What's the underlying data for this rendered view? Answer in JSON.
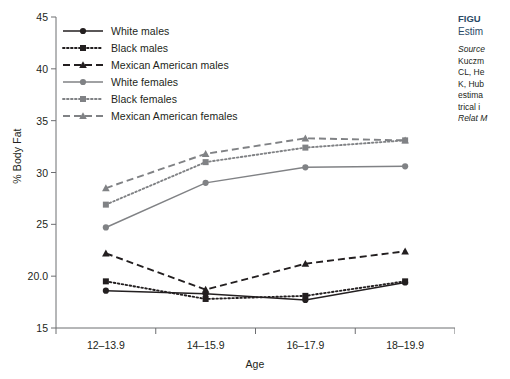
{
  "chart_data": {
    "type": "line",
    "title": "",
    "xlabel": "Age",
    "ylabel": "% Body Fat",
    "categories": [
      "12–13.9",
      "14–15.9",
      "16–17.9",
      "18–19.9"
    ],
    "ylim": [
      15,
      45
    ],
    "yticks": [
      "15",
      "20.0",
      "25",
      "30",
      "35",
      "40",
      "45"
    ],
    "ytick_values": [
      15,
      20,
      25,
      30,
      35,
      40,
      45
    ],
    "grid": false,
    "legend_position": "upper-left-inside",
    "series": [
      {
        "name": "White males",
        "values": [
          18.6,
          18.3,
          17.7,
          19.4
        ],
        "color": "#231f20",
        "line_style": "solid",
        "marker": "circle"
      },
      {
        "name": "Black males",
        "values": [
          19.5,
          17.8,
          18.1,
          19.5
        ],
        "color": "#231f20",
        "line_style": "dotted",
        "marker": "square"
      },
      {
        "name": "Mexican American males",
        "values": [
          22.2,
          18.7,
          21.2,
          22.4
        ],
        "color": "#231f20",
        "line_style": "dashed",
        "marker": "triangle"
      },
      {
        "name": "White females",
        "values": [
          24.7,
          29.0,
          30.5,
          30.6
        ],
        "color": "#808285",
        "line_style": "solid",
        "marker": "circle"
      },
      {
        "name": "Black females",
        "values": [
          26.9,
          31.0,
          32.4,
          33.1
        ],
        "color": "#808285",
        "line_style": "dotted",
        "marker": "square"
      },
      {
        "name": "Mexican American females",
        "values": [
          28.5,
          31.8,
          33.3,
          33.1
        ],
        "color": "#808285",
        "line_style": "dashed",
        "marker": "triangle"
      }
    ]
  },
  "caption": {
    "figure_label": "FIGU",
    "subtitle": "Estim",
    "source_lines": [
      "Source",
      "Kuczm",
      "CL, He",
      "K, Hub",
      "estima",
      "trical i",
      "Relat M"
    ],
    "italic_flags": [
      true,
      false,
      false,
      false,
      false,
      false,
      true
    ]
  },
  "colors": {
    "male": "#231f20",
    "female": "#808285",
    "axis": "#58595b",
    "caption_heading": "#2a4a66"
  }
}
